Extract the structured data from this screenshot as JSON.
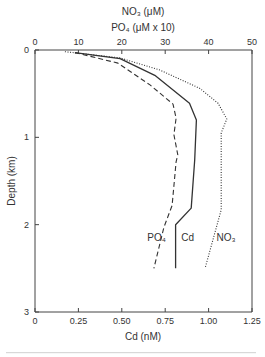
{
  "chart_data": {
    "type": "line",
    "orientation": "depth-profile",
    "title": "",
    "top_axis": {
      "titles": [
        "NO₃ (μM)",
        "PO₄ (μM x 10)"
      ],
      "range": [
        0,
        50
      ],
      "ticks": [
        0,
        10,
        20,
        30,
        40,
        50
      ],
      "tick_labels": [
        "0",
        "10",
        "20",
        "30",
        "40",
        "50"
      ]
    },
    "bottom_axis": {
      "title": "Cd (nM)",
      "range": [
        0,
        1.25
      ],
      "ticks": [
        0,
        0.25,
        0.5,
        0.75,
        1.0,
        1.25
      ],
      "tick_labels": [
        "0",
        "0.25",
        "0.50",
        "0.75",
        "1.00",
        "1.25"
      ]
    },
    "y_axis": {
      "title": "Depth (km)",
      "range": [
        0,
        3
      ],
      "inverted": true,
      "ticks": [
        0,
        1,
        2,
        3
      ],
      "tick_labels": [
        "0",
        "1",
        "2",
        "3"
      ]
    },
    "grid": false,
    "series": [
      {
        "name": "Cd",
        "label": "Cd",
        "axis": "bottom",
        "style": "solid",
        "color": "#333333",
        "points": [
          {
            "value": 0.23,
            "depth": 0.03
          },
          {
            "value": 0.49,
            "depth": 0.1
          },
          {
            "value": 0.69,
            "depth": 0.29
          },
          {
            "value": 0.89,
            "depth": 0.61
          },
          {
            "value": 0.93,
            "depth": 0.8
          },
          {
            "value": 0.92,
            "depth": 1.26
          },
          {
            "value": 0.9,
            "depth": 1.81
          },
          {
            "value": 0.81,
            "depth": 2.0
          },
          {
            "value": 0.81,
            "depth": 2.5
          }
        ]
      },
      {
        "name": "PO4",
        "label": "PO₄",
        "axis": "top",
        "style": "dashed",
        "color": "#333333",
        "points": [
          {
            "value": 9.2,
            "depth": 0.03
          },
          {
            "value": 19.1,
            "depth": 0.15
          },
          {
            "value": 26.5,
            "depth": 0.4
          },
          {
            "value": 31.8,
            "depth": 0.62
          },
          {
            "value": 32.5,
            "depth": 0.78
          },
          {
            "value": 32.0,
            "depth": 0.97
          },
          {
            "value": 32.9,
            "depth": 1.2
          },
          {
            "value": 32.5,
            "depth": 1.28
          },
          {
            "value": 31.6,
            "depth": 1.78
          },
          {
            "value": 29.7,
            "depth": 2.03
          },
          {
            "value": 27.4,
            "depth": 2.5
          }
        ]
      },
      {
        "name": "NO3",
        "label": "NO₃",
        "axis": "top",
        "style": "dotted",
        "color": "#333333",
        "points": [
          {
            "value": 6.9,
            "depth": 0.02
          },
          {
            "value": 19.6,
            "depth": 0.09
          },
          {
            "value": 28.8,
            "depth": 0.23
          },
          {
            "value": 38.0,
            "depth": 0.44
          },
          {
            "value": 42.2,
            "depth": 0.61
          },
          {
            "value": 44.2,
            "depth": 0.79
          },
          {
            "value": 42.9,
            "depth": 0.95
          },
          {
            "value": 42.9,
            "depth": 1.83
          },
          {
            "value": 39.2,
            "depth": 2.5
          }
        ]
      }
    ],
    "annotations": [
      {
        "text": "PO₄",
        "series": "PO4",
        "value_cd_scale": 0.7,
        "depth": 2.15
      },
      {
        "text": "Cd",
        "series": "Cd",
        "value_cd_scale": 0.88,
        "depth": 2.15
      },
      {
        "text": "NO₃",
        "series": "NO3",
        "value_cd_scale": 1.1,
        "depth": 2.15
      }
    ]
  }
}
